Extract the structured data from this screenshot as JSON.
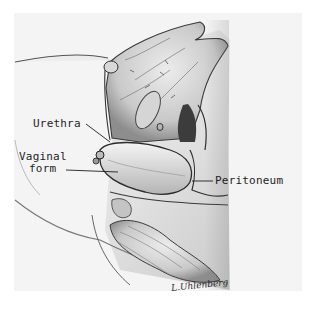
{
  "figure": {
    "type": "anatomical-illustration",
    "style": "grayscale pencil drawing",
    "labels": {
      "urethra": "Urethra",
      "vaginal_form_line1": "Vaginal",
      "vaginal_form_line2": "form",
      "peritoneum": "Peritoneum"
    },
    "signature": "L.Uhlenberg"
  },
  "colors": {
    "background": "#ffffff",
    "panel": "#f4f4f4",
    "ink": "#1e1e1e"
  }
}
